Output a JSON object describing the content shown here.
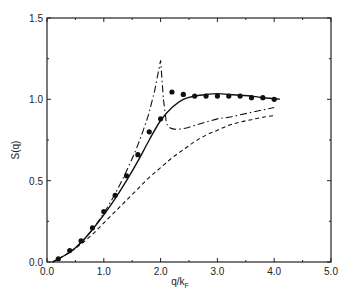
{
  "chart_data": {
    "type": "line",
    "title": "",
    "xlabel": "q/k_F",
    "ylabel": "S(q)",
    "xlim": [
      0.0,
      5.0
    ],
    "ylim": [
      0.0,
      1.5
    ],
    "x_ticks": [
      "0.0",
      "1.0",
      "2.0",
      "3.0",
      "4.0",
      "5.0"
    ],
    "y_ticks": [
      "0.0",
      "0.5",
      "1.0",
      "1.5"
    ],
    "grid": false,
    "legend": null,
    "series": [
      {
        "name": "data points",
        "style": "markers",
        "x": [
          0.2,
          0.4,
          0.6,
          0.8,
          1.0,
          1.2,
          1.4,
          1.6,
          1.8,
          2.0,
          2.2,
          2.4,
          2.6,
          2.8,
          3.0,
          3.2,
          3.4,
          3.6,
          3.8,
          4.0
        ],
        "y": [
          0.02,
          0.07,
          0.13,
          0.21,
          0.31,
          0.41,
          0.53,
          0.66,
          0.8,
          0.88,
          1.045,
          1.03,
          1.02,
          1.02,
          1.02,
          1.02,
          1.02,
          1.01,
          1.01,
          1.0
        ]
      },
      {
        "name": "solid curve",
        "style": "solid",
        "x": [
          0.1,
          0.4,
          0.6,
          0.8,
          1.0,
          1.2,
          1.4,
          1.6,
          1.8,
          2.0,
          2.2,
          2.4,
          2.6,
          2.8,
          3.0,
          3.2,
          3.4,
          3.6,
          3.8,
          4.0,
          4.1
        ],
        "y": [
          0.0,
          0.06,
          0.12,
          0.2,
          0.29,
          0.39,
          0.5,
          0.62,
          0.75,
          0.87,
          0.95,
          1.0,
          1.02,
          1.03,
          1.035,
          1.03,
          1.025,
          1.02,
          1.01,
          1.005,
          1.0
        ]
      },
      {
        "name": "dash-dot curve",
        "style": "dash-dot",
        "x": [
          0.1,
          0.4,
          0.6,
          0.8,
          1.0,
          1.2,
          1.4,
          1.6,
          1.8,
          1.9,
          2.0,
          2.05,
          2.1,
          2.2,
          2.4,
          2.6,
          2.8,
          3.0,
          3.2,
          3.4,
          3.6,
          3.8,
          4.0
        ],
        "y": [
          0.0,
          0.06,
          0.12,
          0.2,
          0.3,
          0.42,
          0.56,
          0.72,
          0.92,
          1.06,
          1.24,
          1.0,
          0.86,
          0.82,
          0.82,
          0.84,
          0.86,
          0.88,
          0.89,
          0.905,
          0.92,
          0.935,
          0.95
        ]
      },
      {
        "name": "dashed curve",
        "style": "dashed",
        "x": [
          0.1,
          0.4,
          0.6,
          0.8,
          1.0,
          1.2,
          1.4,
          1.6,
          1.8,
          2.0,
          2.2,
          2.4,
          2.6,
          2.8,
          3.0,
          3.2,
          3.4,
          3.6,
          3.8,
          4.0
        ],
        "y": [
          0.0,
          0.06,
          0.11,
          0.17,
          0.24,
          0.31,
          0.38,
          0.45,
          0.52,
          0.58,
          0.64,
          0.69,
          0.74,
          0.78,
          0.81,
          0.84,
          0.86,
          0.875,
          0.89,
          0.9
        ]
      }
    ]
  },
  "labels": {
    "ylabel": "S(q)",
    "xlabel_main": "q/k",
    "xlabel_sub": "F"
  }
}
